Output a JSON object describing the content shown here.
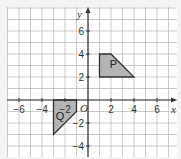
{
  "diagram": {
    "type": "coordinate-grid",
    "axes": {
      "x_label": "x",
      "y_label": "y",
      "origin_label": "O",
      "x_ticks": [
        {
          "value": -6,
          "label": "−6"
        },
        {
          "value": -4,
          "label": "−4"
        },
        {
          "value": -2,
          "label": "−2"
        },
        {
          "value": 2,
          "label": "2"
        },
        {
          "value": 4,
          "label": "4"
        },
        {
          "value": 6,
          "label": "6"
        }
      ],
      "y_ticks": [
        {
          "value": 6,
          "label": "6"
        },
        {
          "value": 4,
          "label": "4"
        },
        {
          "value": 2,
          "label": "2"
        },
        {
          "value": -2,
          "label": "−2"
        },
        {
          "value": -4,
          "label": "−4"
        }
      ],
      "x_range": [
        -7,
        7.7
      ],
      "y_range": [
        -5,
        8.1
      ]
    },
    "shapes": [
      {
        "label": "P",
        "vertices": [
          [
            1,
            4
          ],
          [
            2,
            4
          ],
          [
            4,
            2
          ],
          [
            1,
            2
          ]
        ],
        "fill": "#b4b4b4"
      },
      {
        "label": "Q",
        "vertices": [
          [
            -3,
            0
          ],
          [
            -1,
            0
          ],
          [
            -1,
            -1
          ],
          [
            -3,
            -3
          ]
        ],
        "fill": "#b4b4b4"
      }
    ],
    "colors": {
      "background": "#f4f4f4",
      "grid_fill": "#ffffff",
      "grid_line": "#bdbdbd",
      "axis": "#333333",
      "shape_fill": "#b4b4b4",
      "shape_stroke": "#333333"
    }
  }
}
